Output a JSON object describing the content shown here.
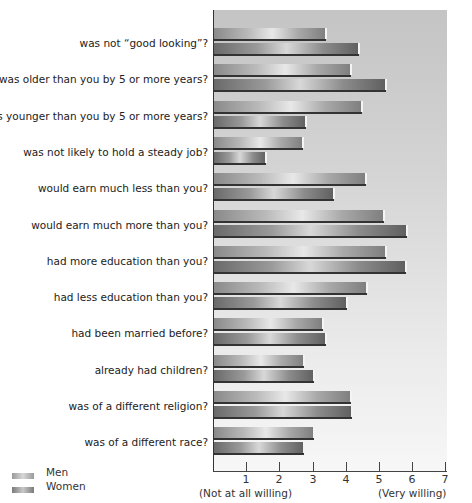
{
  "chart_data": {
    "type": "bar",
    "orientation": "horizontal",
    "title": "",
    "xlabel": "",
    "ylabel": "",
    "xlim": [
      0,
      7
    ],
    "x_ticks": [
      "1",
      "2",
      "3",
      "4",
      "5",
      "6",
      "7"
    ],
    "x_axis_notes": {
      "low": "(Not at all willing)",
      "high": "(Very willing)"
    },
    "categories": [
      "was not “good looking”?",
      "was older than you by 5 or more years?",
      "was younger than you by 5 or more years?",
      "was not likely to hold a steady job?",
      "would earn much less than you?",
      "would earn much more than you?",
      "had more education than you?",
      "had less education than you?",
      "had been married before?",
      "already had children?",
      "was of a different religion?",
      "was of a different race?"
    ],
    "series": [
      {
        "name": "Men",
        "values": [
          3.4,
          4.15,
          4.5,
          2.7,
          4.6,
          5.15,
          5.2,
          4.65,
          3.3,
          2.75,
          4.15,
          3.05
        ]
      },
      {
        "name": "Women",
        "values": [
          4.4,
          5.2,
          2.8,
          1.6,
          3.65,
          5.85,
          5.8,
          4.05,
          3.4,
          3.05,
          4.2,
          2.75
        ]
      }
    ],
    "legend": {
      "position": "bottom-left",
      "entries": [
        "Men",
        "Women"
      ]
    },
    "grid": false
  },
  "legend": {
    "men": "Men",
    "women": "Women"
  }
}
